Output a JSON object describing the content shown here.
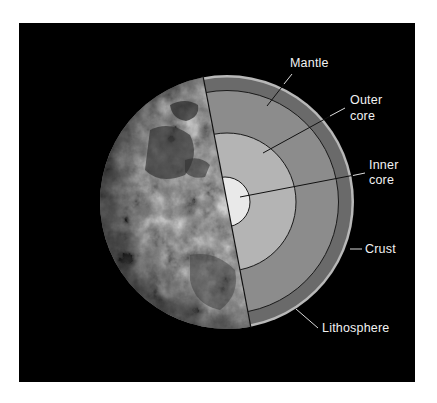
{
  "figure": {
    "type": "earth-cutaway",
    "background": "#000000",
    "page_background": "#ffffff"
  },
  "layers": {
    "inner_core": {
      "color": "#e9e9e9"
    },
    "outer_core": {
      "color": "#b4b4b4"
    },
    "mantle": {
      "color": "#8c8c8c"
    },
    "lithosphere": {
      "color": "#6a6a6a"
    },
    "crust": {
      "color": "#b8b8b8"
    }
  },
  "labels": {
    "mantle": "Mantle",
    "outer_core_line1": "Outer",
    "outer_core_line2": "core",
    "inner_core_line1": "Inner",
    "inner_core_line2": "core",
    "crust": "Crust",
    "lithosphere": "Lithosphere"
  }
}
